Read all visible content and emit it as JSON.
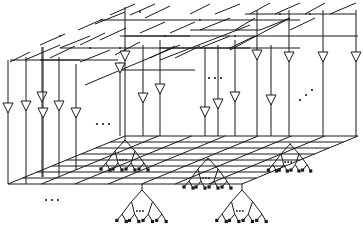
{
  "diagram": {
    "type": "3d-mesh-network",
    "colors": {
      "stroke": "#1a1a1a",
      "background": "#ffffff"
    },
    "grid": {
      "back_left": [
        125,
        136
      ],
      "back_right": [
        358,
        136
      ],
      "front_left": [
        8,
        184
      ],
      "front_right": [
        242,
        184
      ],
      "rows": 8,
      "cols": 7
    },
    "vertical_lines": [
      {
        "x": 8,
        "y1": 60,
        "y2": 184,
        "tri_y": 108
      },
      {
        "x": 26,
        "y1": 57,
        "y2": 184,
        "tri_y": 106
      },
      {
        "x": 42,
        "y1": 47,
        "y2": 177,
        "tri_y": 97
      },
      {
        "x": 43,
        "y1": 47,
        "y2": 177,
        "tri_y": 113
      },
      {
        "x": 59,
        "y1": 57,
        "y2": 177,
        "tri_y": 106
      },
      {
        "x": 76,
        "y1": 64,
        "y2": 170,
        "tri_y": 113
      },
      {
        "x": 125,
        "y1": 7,
        "y2": 136,
        "tri_y": 56
      },
      {
        "x": 120,
        "y1": 62,
        "y2": 136,
        "tri_y": 68
      },
      {
        "x": 143,
        "y1": 45,
        "y2": 136,
        "tri_y": 98
      },
      {
        "x": 160,
        "y1": 40,
        "y2": 136,
        "tri_y": 89
      },
      {
        "x": 205,
        "y1": 48,
        "y2": 136,
        "tri_y": 112
      },
      {
        "x": 218,
        "y1": 45,
        "y2": 136,
        "tri_y": 104
      },
      {
        "x": 235,
        "y1": 40,
        "y2": 136,
        "tri_y": 97
      },
      {
        "x": 257,
        "y1": 10,
        "y2": 136,
        "tri_y": 55
      },
      {
        "x": 271,
        "y1": 45,
        "y2": 136,
        "tri_y": 100
      },
      {
        "x": 289,
        "y1": 10,
        "y2": 136,
        "tri_y": 57
      },
      {
        "x": 323,
        "y1": 10,
        "y2": 136,
        "tri_y": 57
      },
      {
        "x": 356,
        "y1": 10,
        "y2": 136,
        "tri_y": 57
      }
    ],
    "ellipses": [
      {
        "x": 97,
        "y": 124,
        "dir": "h"
      },
      {
        "x": 46,
        "y": 200,
        "dir": "h"
      },
      {
        "x": 209,
        "y": 78,
        "dir": "h"
      },
      {
        "x": 300,
        "y": 100,
        "dir": "diag"
      }
    ],
    "trees": [
      {
        "root": [
          125,
          136
        ],
        "top": 140,
        "scale": 1.0
      },
      {
        "root": [
          208,
          160
        ],
        "top": 158,
        "scale": 1.0
      },
      {
        "root": [
          290,
          143
        ],
        "top": 144,
        "scale": 0.9
      },
      {
        "root": [
          142,
          184
        ],
        "top": 190,
        "scale": 1.05
      },
      {
        "root": [
          242,
          184
        ],
        "top": 190,
        "scale": 1.05
      }
    ]
  }
}
